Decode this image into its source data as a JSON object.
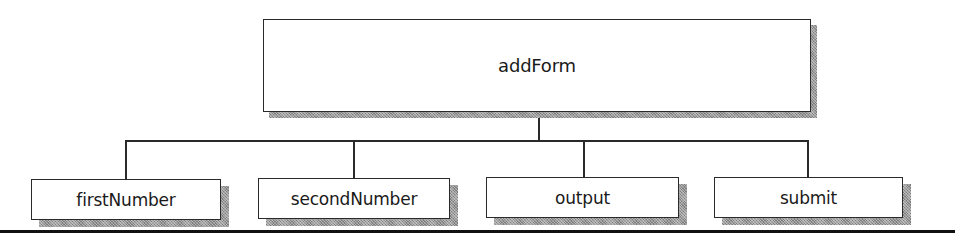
{
  "diagram": {
    "type": "tree",
    "root": {
      "label": "addForm"
    },
    "children": [
      {
        "label": "firstNumber"
      },
      {
        "label": "secondNumber"
      },
      {
        "label": "output"
      },
      {
        "label": "submit"
      }
    ],
    "colors": {
      "stroke": "#2a2a2a",
      "fill": "#ffffff",
      "shadow": "#9a9a9a",
      "rule": "#111111"
    }
  }
}
